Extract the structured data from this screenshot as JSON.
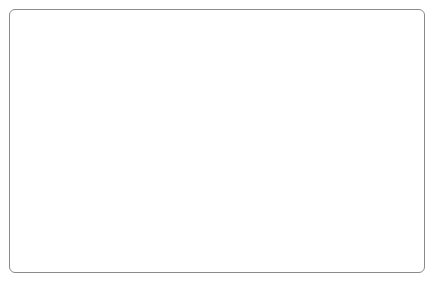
{
  "chart_data": {
    "type": "line",
    "title": "",
    "subtitle": "",
    "xlabel": "",
    "ylabel": "",
    "grid": false,
    "legend": "none",
    "left_axis": {
      "label": "",
      "ticks": [
        "0%",
        "-5%",
        "-10%",
        "-15%",
        "-20%",
        "-25%",
        "-30%",
        "-35%"
      ],
      "values": [
        0,
        -5,
        -10,
        -15,
        -20,
        -25,
        -30,
        -35
      ],
      "ylim": [
        -35,
        0
      ]
    },
    "right_axis": {
      "label": "",
      "ticks": [
        "0%",
        "5 %",
        "10 %",
        "15 %",
        "20 %",
        "25 %",
        "30 %",
        "35%"
      ],
      "values": [
        0,
        5,
        10,
        15,
        20,
        25,
        30,
        35
      ],
      "ylim": [
        35,
        0
      ]
    },
    "x_tick_labels": [
      "1985",
      "1986",
      "1987",
      "1988",
      "1989",
      "1990",
      "1991",
      "1992",
      "1993",
      "1994",
      "1995",
      "1996",
      "1997",
      "1998"
    ],
    "x_minor_ticks_per_year": 4,
    "xlim": [
      1985,
      1998.75
    ],
    "series": [
      {
        "name": "series-1",
        "color": "#2b2b2b",
        "x": [
          1985.0,
          1985.25,
          1985.5,
          1985.75,
          1986.0,
          1986.25,
          1986.5,
          1986.75,
          1987.0,
          1987.25,
          1987.5,
          1987.75,
          1988.0,
          1988.25,
          1988.5,
          1988.75,
          1989.0,
          1989.25,
          1989.5,
          1989.75,
          1990.0,
          1990.25,
          1990.5,
          1990.75,
          1991.0,
          1991.25,
          1991.5,
          1991.75,
          1992.0,
          1992.25,
          1992.5,
          1992.75,
          1993.0,
          1993.25,
          1993.5,
          1993.75,
          1994.0,
          1994.25,
          1994.5,
          1994.75,
          1995.0,
          1995.25,
          1995.5,
          1995.75,
          1996.0,
          1996.25,
          1996.5,
          1996.75,
          1997.0,
          1997.25,
          1997.5,
          1997.75,
          1998.0,
          1998.25,
          1998.5
        ],
        "y": [
          -15.6,
          -14.6,
          -13.9,
          -15.6,
          -17.2,
          -16.6,
          -15.6,
          -13.6,
          -10.2,
          -13.0,
          -15.4,
          -18.1,
          -13.6,
          -9.5,
          -6.6,
          -4.8,
          -5.4,
          -5.6,
          -5.6,
          -6.5,
          -6.8,
          -7.4,
          -9.8,
          -12.3,
          -10.0,
          -8.4,
          -7.0,
          -7.6,
          -12.6,
          -14.9,
          -15.2,
          -15.2,
          -14.9,
          -14.0,
          -13.8,
          -14.1,
          -13.0,
          -11.6,
          -10.2,
          -10.4,
          -12.6,
          -15.0,
          -17.4,
          -19.6,
          -21.2,
          -23.1,
          -24.9,
          -24.9,
          -24.6,
          -23.8,
          -24.2,
          -24.9,
          -27.4,
          -30.2,
          -33.5
        ]
      }
    ]
  }
}
